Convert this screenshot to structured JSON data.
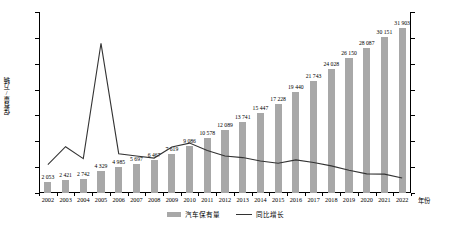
{
  "chart_data": {
    "type": "bar",
    "title": "",
    "xlabel": "年份",
    "ylabel": "保有量/万辆",
    "ylabel_right": "",
    "ylim": [
      0,
      35000
    ],
    "ylim_right": [
      0,
      0.7
    ],
    "grid": false,
    "legend_position": "bottom",
    "categories": [
      "2002",
      "2003",
      "2004",
      "2005",
      "2006",
      "2007",
      "2008",
      "2009",
      "2010",
      "2011",
      "2012",
      "2013",
      "2014",
      "2015",
      "2016",
      "2017",
      "2018",
      "2019",
      "2020",
      "2021",
      "2022"
    ],
    "y_ticks": [
      "0",
      "5 000",
      "10 000",
      "15 000",
      "20 000",
      "25 000",
      "30 000",
      "35 000"
    ],
    "y_tick_values": [
      0,
      5000,
      10000,
      15000,
      20000,
      25000,
      30000,
      35000
    ],
    "y_ticks_right": [
      "0%",
      "10%",
      "20%",
      "30%",
      "40%",
      "50%",
      "60%",
      "70%"
    ],
    "y_tick_values_right": [
      0,
      10,
      20,
      30,
      40,
      50,
      60,
      70
    ],
    "series": [
      {
        "name": "汽车保有量",
        "type": "bar",
        "axis": "left",
        "color": "#a8a8a8",
        "values": [
          2053,
          2421,
          2742,
          4329,
          4985,
          5697,
          6467,
          7619,
          9086,
          10578,
          12089,
          13741,
          15447,
          17228,
          19440,
          21743,
          24028,
          26150,
          28087,
          30151,
          31903
        ],
        "labels": [
          "2 053",
          "2 421",
          "2 742",
          "4 329",
          "4 985",
          "5 697",
          "6 467",
          "7 619",
          "9 086",
          "10 578",
          "12 089",
          "13 741",
          "15 447",
          "17 228",
          "19 440",
          "21 743",
          "24 028",
          "26 150",
          "28 087",
          "30 151",
          "31 903"
        ]
      },
      {
        "name": "同比增长",
        "type": "line",
        "axis": "right",
        "color": "#333333",
        "values": [
          11.0,
          17.9,
          13.3,
          57.9,
          15.2,
          14.3,
          13.5,
          17.8,
          19.3,
          16.4,
          14.3,
          13.7,
          12.4,
          11.5,
          12.8,
          11.8,
          10.5,
          8.8,
          7.4,
          7.3,
          5.8
        ]
      }
    ]
  },
  "legend": {
    "items": [
      {
        "label": "汽车保有量",
        "marker": "bar"
      },
      {
        "label": "同比增长",
        "marker": "line"
      }
    ]
  }
}
